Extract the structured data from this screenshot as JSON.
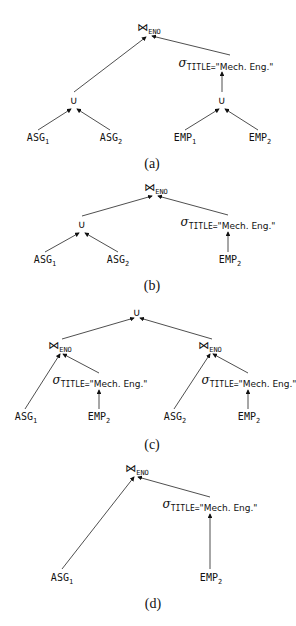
{
  "figures": [
    {
      "caption": "(a)",
      "nodes": {
        "join": {
          "op": "⋈",
          "sub": "ENO"
        },
        "union_left": {
          "op": "∪"
        },
        "union_right": {
          "op": "∪"
        },
        "select": {
          "sigma": "σ",
          "cond_attr": "TITLE=",
          "cond_val": "\"Mech. Eng.\""
        },
        "asg1": {
          "name": "ASG",
          "sub": "1"
        },
        "asg2": {
          "name": "ASG",
          "sub": "2"
        },
        "emp1": {
          "name": "EMP",
          "sub": "1"
        },
        "emp2": {
          "name": "EMP",
          "sub": "2"
        }
      }
    },
    {
      "caption": "(b)",
      "nodes": {
        "join": {
          "op": "⋈",
          "sub": "ENO"
        },
        "union": {
          "op": "∪"
        },
        "select": {
          "sigma": "σ",
          "cond_attr": "TITLE=",
          "cond_val": "\"Mech. Eng.\""
        },
        "asg1": {
          "name": "ASG",
          "sub": "1"
        },
        "asg2": {
          "name": "ASG",
          "sub": "2"
        },
        "emp2": {
          "name": "EMP",
          "sub": "2"
        }
      }
    },
    {
      "caption": "(c)",
      "nodes": {
        "union": {
          "op": "∪"
        },
        "join_left": {
          "op": "⋈",
          "sub": "ENO"
        },
        "join_right": {
          "op": "⋈",
          "sub": "ENO"
        },
        "select_left": {
          "sigma": "σ",
          "cond_attr": "TITLE=",
          "cond_val": "\"Mech. Eng.\""
        },
        "select_right": {
          "sigma": "σ",
          "cond_attr": "TITLE=",
          "cond_val": "\"Mech. Eng.\""
        },
        "asg1": {
          "name": "ASG",
          "sub": "1"
        },
        "emp2_left": {
          "name": "EMP",
          "sub": "2"
        },
        "asg2": {
          "name": "ASG",
          "sub": "2"
        },
        "emp2_right": {
          "name": "EMP",
          "sub": "2"
        }
      }
    },
    {
      "caption": "(d)",
      "nodes": {
        "join": {
          "op": "⋈",
          "sub": "ENO"
        },
        "select": {
          "sigma": "σ",
          "cond_attr": "TITLE=",
          "cond_val": "\"Mech. Eng.\""
        },
        "asg1": {
          "name": "ASG",
          "sub": "1"
        },
        "emp2": {
          "name": "EMP",
          "sub": "2"
        }
      }
    }
  ]
}
